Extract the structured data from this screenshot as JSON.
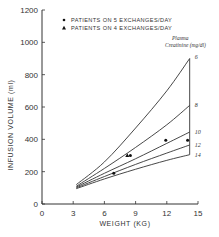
{
  "chart_data": {
    "type": "line",
    "title": "",
    "xlabel": "WEIGHT (KG)",
    "ylabel": "INFUSION VOLUME (ml)",
    "xlim": [
      0,
      15
    ],
    "ylim": [
      0,
      1200
    ],
    "xticks": [
      0,
      3,
      6,
      9,
      12,
      15
    ],
    "yticks": [
      0,
      200,
      400,
      600,
      800,
      1000,
      1200
    ],
    "grid": false,
    "legend": [
      {
        "marker": "circle",
        "label": "PATIENTS  ON 5 EXCHANGES/DAY"
      },
      {
        "marker": "triangle",
        "label": "PATIENTS  ON 4 EXCHANGES/DAY"
      }
    ],
    "legend_position": "top",
    "annotation": {
      "line1": "Plasma",
      "line2": "Creatinine (mg/dl)"
    },
    "series": [
      {
        "name": "6",
        "x": [
          3.3,
          6,
          9,
          12,
          14.2
        ],
        "y": [
          120,
          260,
          470,
          700,
          900
        ]
      },
      {
        "name": "8",
        "x": [
          3.3,
          6,
          9,
          12,
          14.2
        ],
        "y": [
          110,
          220,
          350,
          490,
          610
        ]
      },
      {
        "name": "10",
        "x": [
          3.3,
          6,
          9,
          12,
          14.2
        ],
        "y": [
          105,
          190,
          280,
          375,
          445
        ]
      },
      {
        "name": "12",
        "x": [
          3.3,
          6,
          9,
          12,
          14.2
        ],
        "y": [
          100,
          170,
          245,
          315,
          365
        ]
      },
      {
        "name": "14",
        "x": [
          3.3,
          6,
          9,
          12,
          14.2
        ],
        "y": [
          95,
          155,
          215,
          270,
          305
        ]
      }
    ],
    "points": [
      {
        "marker": "circle",
        "x": 6.9,
        "y": 190
      },
      {
        "marker": "triangle",
        "x": 8.2,
        "y": 300
      },
      {
        "marker": "circle",
        "x": 8.5,
        "y": 300
      },
      {
        "marker": "circle",
        "x": 11.9,
        "y": 395
      },
      {
        "marker": "circle",
        "x": 14.0,
        "y": 395
      }
    ]
  }
}
